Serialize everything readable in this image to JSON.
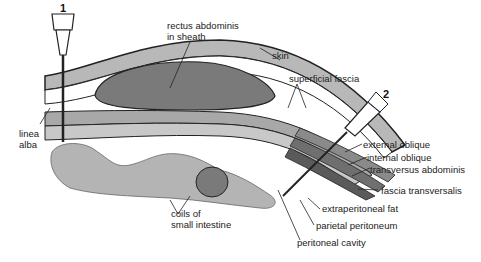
{
  "diagram": {
    "type": "anatomical cross-section",
    "needles": [
      {
        "number": "1",
        "site": "linea alba (midline)"
      },
      {
        "number": "2",
        "site": "lateral abdominal wall"
      }
    ],
    "labels": {
      "rectus": "rectus abdominis",
      "rectus2": "in sheath",
      "skin": "skin",
      "superficial_fascia": "superficial fascia",
      "linea": "linea",
      "alba": "alba",
      "external_oblique": "external oblique",
      "internal_oblique": "internal oblique",
      "transversus": "transversus abdominis",
      "fascia_transversalis": "fascia transversalis",
      "extraperitoneal_fat": "extraperitoneal fat",
      "parietal_peritoneum": "parietal peritoneum",
      "peritoneal_cavity": "peritoneal cavity",
      "coils1": "coils of",
      "coils2": "small intestine"
    },
    "colors": {
      "outline": "#222222",
      "layer_gray": "#a8a8a8",
      "dark_gray": "#6f6f6f",
      "intestine": "#b4b4b4",
      "background": "#ffffff"
    }
  }
}
